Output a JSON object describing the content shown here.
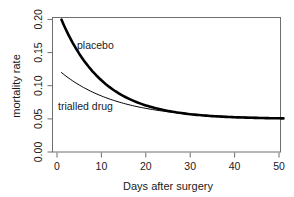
{
  "chart_data": {
    "type": "line",
    "title": "",
    "xlabel": "Days after surgery",
    "ylabel": "mortality rate",
    "xlim": [
      0,
      51
    ],
    "ylim": [
      0.0,
      0.205
    ],
    "xticks": [
      0,
      10,
      20,
      30,
      40,
      50
    ],
    "xticklabels": [
      "0",
      "10",
      "20",
      "30",
      "40",
      "50"
    ],
    "yticks": [
      0.0,
      0.05,
      0.1,
      0.15,
      0.2
    ],
    "yticklabels": [
      "0.00",
      "0.05",
      "0.10",
      "0.15",
      "0.20"
    ],
    "grid": false,
    "legend": "inline-annotations",
    "asymptote": 0.05,
    "series": [
      {
        "name": "placebo",
        "label": "placebo",
        "color": "#000000",
        "linewidth": 2.6,
        "start_value": 0.2,
        "end_value": 0.051,
        "decay_rate": 0.105,
        "x": [
          1,
          3,
          5,
          7,
          9,
          11,
          13,
          15,
          17,
          19,
          21,
          23,
          25,
          27,
          29,
          31,
          33,
          35,
          37,
          39,
          41,
          43,
          45,
          47,
          49,
          51
        ],
        "y": [
          0.2,
          0.172,
          0.15,
          0.132,
          0.117,
          0.105,
          0.096,
          0.088,
          0.082,
          0.077,
          0.073,
          0.069,
          0.066,
          0.064,
          0.062,
          0.06,
          0.059,
          0.058,
          0.057,
          0.056,
          0.055,
          0.054,
          0.053,
          0.053,
          0.052,
          0.051
        ]
      },
      {
        "name": "trialled-drug",
        "label": "trialled drug",
        "color": "#000000",
        "linewidth": 1.0,
        "start_value": 0.12,
        "end_value": 0.05,
        "decay_rate": 0.078,
        "x": [
          1,
          3,
          5,
          7,
          9,
          11,
          13,
          15,
          17,
          19,
          21,
          23,
          25,
          27,
          29,
          31,
          33,
          35,
          37,
          39,
          41,
          43,
          45,
          47,
          49,
          51
        ],
        "y": [
          0.12,
          0.111,
          0.103,
          0.096,
          0.09,
          0.085,
          0.08,
          0.076,
          0.073,
          0.07,
          0.067,
          0.065,
          0.063,
          0.061,
          0.06,
          0.058,
          0.057,
          0.056,
          0.055,
          0.055,
          0.054,
          0.053,
          0.053,
          0.052,
          0.052,
          0.051
        ]
      }
    ],
    "annotations": [
      {
        "text": "placebo",
        "x_px": 77,
        "y_px": 49
      },
      {
        "text": "trialled drug",
        "x_px": 58,
        "y_px": 110
      }
    ]
  }
}
